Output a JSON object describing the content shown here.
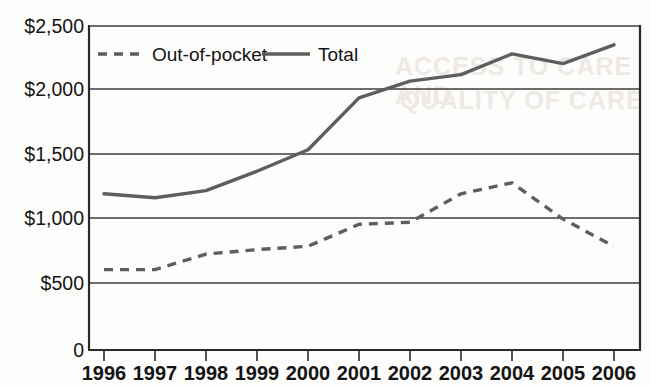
{
  "chart_data": {
    "type": "line",
    "title": "",
    "subtitle": "",
    "xlabel": "",
    "ylabel": "",
    "categories": [
      "1996",
      "1997",
      "1998",
      "1999",
      "2000",
      "2001",
      "2002",
      "2003",
      "2004",
      "2005",
      "2006"
    ],
    "x": [
      1996,
      1997,
      1998,
      1999,
      2000,
      2001,
      2002,
      2003,
      2004,
      2005,
      2006
    ],
    "series": [
      {
        "name": "Out-of-pocket",
        "style": "dashed",
        "color": "#5e5e5e",
        "values": [
          620,
          620,
          740,
          775,
          800,
          970,
          985,
          1205,
          1290,
          1010,
          800
        ]
      },
      {
        "name": "Total",
        "style": "solid",
        "color": "#5e5e5e",
        "values": [
          1205,
          1175,
          1230,
          1380,
          1545,
          1945,
          2075,
          2125,
          2285,
          2210,
          2355
        ]
      }
    ],
    "ylim": [
      0,
      2500
    ],
    "yticks": [
      0,
      500,
      1000,
      1500,
      2000,
      2500
    ],
    "ytick_labels": [
      "0",
      "$500",
      "$1,000",
      "$1,500",
      "$2,000",
      "$2,500"
    ],
    "xtick_labels": [
      "1996",
      "1997",
      "1998",
      "1999",
      "2000",
      "2001",
      "2002",
      "2003",
      "2004",
      "2005",
      "2006"
    ],
    "grid": "horizontal",
    "legend_position": "top-left-inside",
    "legend_entries": [
      {
        "label": "Out-of-pocket",
        "style": "dashed"
      },
      {
        "label": "Total",
        "style": "solid"
      }
    ]
  },
  "legend": {
    "out_of_pocket_label": "Out-of-pocket",
    "total_label": "Total"
  },
  "axes": {
    "y_labels": [
      "$2,500",
      "$2,000",
      "$1,500",
      "$1,000",
      "$500",
      "0"
    ],
    "x_labels": [
      "1996",
      "1997",
      "1998",
      "1999",
      "2000",
      "2001",
      "2002",
      "2003",
      "2004",
      "2005",
      "2006"
    ]
  },
  "ghost_text": {
    "line1": "ACCESS TO CARE AND",
    "line2": "QUALITY OF CARE"
  }
}
